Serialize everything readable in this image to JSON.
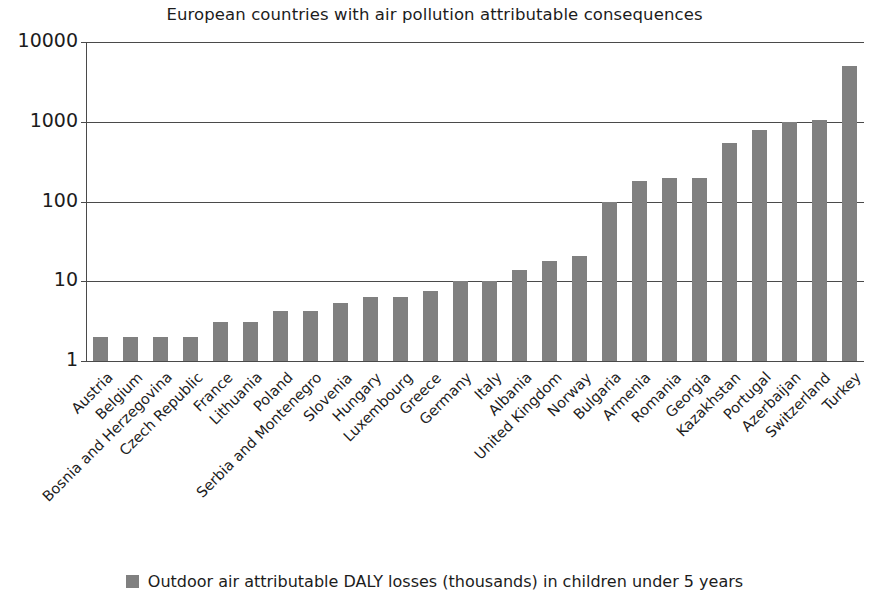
{
  "chart_data": {
    "type": "bar",
    "title": "European countries with air pollution attributable consequences",
    "xlabel": "",
    "ylabel": "",
    "yscale": "log",
    "ylim": [
      1,
      10000
    ],
    "ytick_labels": [
      "1",
      "10",
      "100",
      "1000",
      "10000"
    ],
    "ytick_values": [
      1,
      10,
      100,
      1000,
      10000
    ],
    "grid": true,
    "legend_position": "bottom",
    "legend": [
      "Outdoor air attributable DALY losses (thousands) in children under 5 years"
    ],
    "series": [
      {
        "name": "Outdoor air attributable DALY losses (thousands) in children under 5 years",
        "color": "#808080",
        "values": [
          2.0,
          2.0,
          2.0,
          2.0,
          3.1,
          3.1,
          4.2,
          4.2,
          5.3,
          6.3,
          6.4,
          7.6,
          10,
          10,
          14,
          18,
          21,
          100,
          180,
          200,
          200,
          540,
          790,
          990,
          1060,
          5000
        ]
      }
    ],
    "categories": [
      "Austria",
      "Belgium",
      "Bosnia and Herzegovina",
      "Czech Republic",
      "France",
      "Lithuania",
      "Poland",
      "Serbia and Montenegro",
      "Slovenia",
      "Hungary",
      "Luxembourg",
      "Greece",
      "Germany",
      "Italy",
      "Albania",
      "United Kingdom",
      "Norway",
      "Bulgaria",
      "Armenia",
      "Romania",
      "Georgia",
      "Kazakhstan",
      "Portugal",
      "Azerbaijan",
      "Switzerland",
      "Turkey"
    ],
    "values": [
      2.0,
      2.0,
      2.0,
      2.0,
      3.1,
      3.1,
      4.2,
      4.2,
      5.3,
      6.3,
      6.4,
      7.6,
      10,
      10,
      14,
      18,
      21,
      100,
      180,
      200,
      200,
      540,
      790,
      990,
      1060,
      5000
    ]
  },
  "colors": {
    "bar": "#808080",
    "axis": "#4a4a4a",
    "text": "#1c1c1c",
    "background": "#ffffff"
  }
}
